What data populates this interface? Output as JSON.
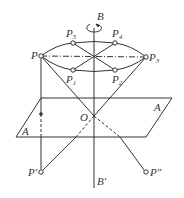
{
  "diagram": {
    "labels": {
      "B": "B",
      "B_prime": "B'",
      "P": "P",
      "P1": "P",
      "P1_sub": "1",
      "P2": "P",
      "P2_sub": "2",
      "P3": "P",
      "P3_sub": "3",
      "P4": "P",
      "P4_sub": "4",
      "P5": "P",
      "P5_sub": "5",
      "O": "O",
      "A_right": "A",
      "A_left": "A",
      "P_prime": "P'",
      "P_double_prime": "P\""
    },
    "colors": {
      "line": "#333333",
      "background": "#ffffff"
    }
  }
}
